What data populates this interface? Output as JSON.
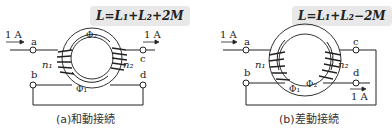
{
  "panel_a": {
    "formula": "L=L₁+L₂+2M",
    "caption": "(a)和動接続",
    "current_in": "1 A",
    "current_out": "1 A",
    "terminals": [
      "a",
      "b",
      "c",
      "d"
    ],
    "coil_labels": [
      "n₁",
      "n₂"
    ],
    "flux_labels": [
      "Φ₂",
      "Φ₁"
    ]
  },
  "panel_b": {
    "formula": "L=L₁+L₂−2M",
    "caption": "(b)差動接続",
    "current_in": "1 A",
    "current_out": "1 A",
    "terminals": [
      "a",
      "b",
      "c",
      "d"
    ],
    "coil_labels": [
      "n₁",
      "n₂"
    ],
    "flux_labels": [
      "Φ₁",
      "Φ₂"
    ]
  }
}
